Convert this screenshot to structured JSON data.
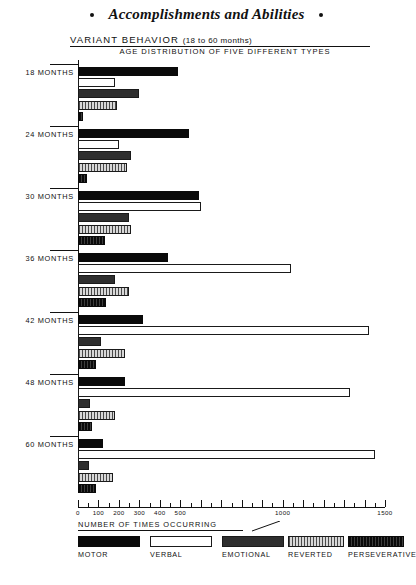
{
  "running_head": {
    "title": "Accomplishments and Abilities",
    "left_marker": "•",
    "right_marker": "•"
  },
  "figure": {
    "title_main": "VARIANT  BEHAVIOR",
    "title_paren": "(18 to 60  months)",
    "subtitle": "AGE  DISTRIBUTION  OF  FIVE  DIFFERENT   TYPES"
  },
  "axis": {
    "label": "NUMBER  OF  TIMES  OCCURRING",
    "min": 0,
    "max": 1500,
    "tick_interval": 50,
    "labeled_ticks": [
      {
        "value": 0,
        "text": "0"
      },
      {
        "value": 100,
        "text": "100"
      },
      {
        "value": 200,
        "text": "200"
      },
      {
        "value": 300,
        "text": "300"
      },
      {
        "value": 400,
        "text": "400"
      },
      {
        "value": 500,
        "text": "500"
      },
      {
        "value": 1000,
        "text": "1000"
      },
      {
        "value": 1500,
        "text": "1500"
      }
    ]
  },
  "legend": {
    "items": [
      {
        "label": "MOTOR",
        "fill": "f-motor",
        "color": "#0a0a0a"
      },
      {
        "label": "VERBAL",
        "fill": "f-verbal",
        "color": "#ffffff"
      },
      {
        "label": "EMOTIONAL",
        "fill": "f-emotional",
        "color": "#8a8a8a"
      },
      {
        "label": "REVERTED",
        "fill": "f-reverted",
        "color": "#9c9c9c"
      },
      {
        "label": "PERSEVERATIVE",
        "fill": "f-perseverative",
        "color": "#151515"
      }
    ]
  },
  "chart_data": {
    "type": "bar",
    "orientation": "horizontal",
    "xlabel": "NUMBER OF TIMES OCCURRING",
    "ylabel": "",
    "xlim": [
      0,
      1500
    ],
    "grid": false,
    "legend_position": "bottom",
    "categories": [
      "18 MONTHS",
      "24 MONTHS",
      "30 MONTHS",
      "36 MONTHS",
      "42 MONTHS",
      "48 MONTHS",
      "60 MONTHS"
    ],
    "series": [
      {
        "name": "MOTOR",
        "values": [
          490,
          540,
          590,
          440,
          320,
          230,
          120
        ]
      },
      {
        "name": "VERBAL",
        "values": [
          180,
          200,
          600,
          1040,
          1420,
          1330,
          1450
        ]
      },
      {
        "name": "EMOTIONAL",
        "values": [
          300,
          260,
          250,
          180,
          110,
          60,
          55
        ]
      },
      {
        "name": "REVERTED",
        "values": [
          190,
          240,
          260,
          250,
          230,
          180,
          170
        ]
      },
      {
        "name": "PERSEVERATIVE",
        "values": [
          25,
          45,
          130,
          135,
          90,
          70,
          90
        ]
      }
    ]
  }
}
